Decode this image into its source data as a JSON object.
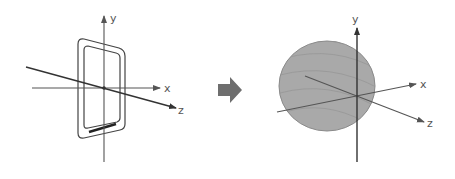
{
  "diagram": {
    "left_panel": {
      "object": "phone",
      "axes": {
        "x_label": "x",
        "y_label": "y",
        "z_label": "z"
      }
    },
    "transition": {
      "icon": "right-arrow-icon"
    },
    "right_panel": {
      "object": "sphere",
      "axes": {
        "x_label": "x",
        "y_label": "y",
        "z_label": "z"
      }
    },
    "colors": {
      "axis": "#555555",
      "z_axis_left": "#333333",
      "sphere_fill": "#a9a9a9",
      "sphere_stroke": "#8a8a8a",
      "arrow": "#6e6e6e",
      "phone_stroke": "#444444"
    }
  }
}
